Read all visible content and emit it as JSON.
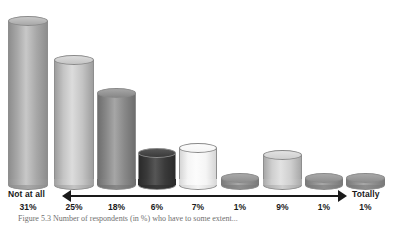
{
  "chart_data": {
    "type": "bar",
    "title": "",
    "subtitle": "",
    "xlabel": "",
    "ylabel": "",
    "grid": false,
    "legend": "none",
    "scale_low_label": "Not at all",
    "scale_high_label": "Totally",
    "categories": [
      "1",
      "2",
      "3",
      "4",
      "5",
      "6",
      "7",
      "8",
      "9"
    ],
    "values": [
      31,
      25,
      18,
      6,
      7,
      1,
      9,
      1,
      1
    ],
    "value_labels": [
      "31%",
      "25%",
      "18%",
      "6%",
      "7%",
      "1%",
      "9%",
      "1%",
      "1%"
    ],
    "ylim": [
      0,
      31
    ],
    "note": "3D cylinder pictogram; drawn cylinder heights are decorative and not strictly proportional to the percentages",
    "bars": [
      {
        "category": "1",
        "value": 31,
        "label": "31%",
        "x": 8,
        "width": 40,
        "top": 16,
        "bottom": 190,
        "body_color": "#a8a8a8",
        "top_color": "#c8c8c8",
        "shade_color": "#8e8e8e"
      },
      {
        "category": "2",
        "value": 25,
        "label": "25%",
        "x": 54,
        "width": 40,
        "top": 55,
        "bottom": 190,
        "body_color": "#c4c4c4",
        "top_color": "#dcdcdc",
        "shade_color": "#9e9e9e"
      },
      {
        "category": "3",
        "value": 18,
        "label": "18%",
        "x": 97,
        "width": 39,
        "top": 88,
        "bottom": 190,
        "body_color": "#888888",
        "top_color": "#a6a6a6",
        "shade_color": "#6e6e6e"
      },
      {
        "category": "4",
        "value": 6,
        "label": "6%",
        "x": 138,
        "width": 38,
        "top": 148,
        "bottom": 190,
        "body_color": "#3a3a3a",
        "top_color": "#565656",
        "shade_color": "#2a2a2a"
      },
      {
        "category": "5",
        "value": 7,
        "label": "7%",
        "x": 179,
        "width": 38,
        "top": 143,
        "bottom": 190,
        "body_color": "#f5f5f5",
        "top_color": "#fcfcfc",
        "shade_color": "#d6d6d6"
      },
      {
        "category": "6",
        "value": 1,
        "label": "1%",
        "x": 221,
        "width": 38,
        "top": 173,
        "bottom": 190,
        "body_color": "#8e8e8e",
        "top_color": "#a8a8a8",
        "shade_color": "#787878"
      },
      {
        "category": "7",
        "value": 9,
        "label": "9%",
        "x": 263,
        "width": 39,
        "top": 150,
        "bottom": 190,
        "body_color": "#cfcfcf",
        "top_color": "#e2e2e2",
        "shade_color": "#a8a8a8"
      },
      {
        "category": "8",
        "value": 1,
        "label": "1%",
        "x": 305,
        "width": 38,
        "top": 173,
        "bottom": 190,
        "body_color": "#8e8e8e",
        "top_color": "#a8a8a8",
        "shade_color": "#787878"
      },
      {
        "category": "9",
        "value": 1,
        "label": "1%",
        "x": 346,
        "width": 39,
        "top": 173,
        "bottom": 190,
        "body_color": "#8e8e8e",
        "top_color": "#a8a8a8",
        "shade_color": "#787878"
      }
    ]
  },
  "axis": {
    "low_label": "Not at all",
    "high_label": "Totally"
  },
  "colors": {
    "background": "#ffffff",
    "text": "#1a1a1a",
    "arrow": "#1a1a1a",
    "caption": "#6f6f6f"
  },
  "caption": {
    "text": "Figure 5.3   Number of respondents (in %) who have to some extent..."
  }
}
